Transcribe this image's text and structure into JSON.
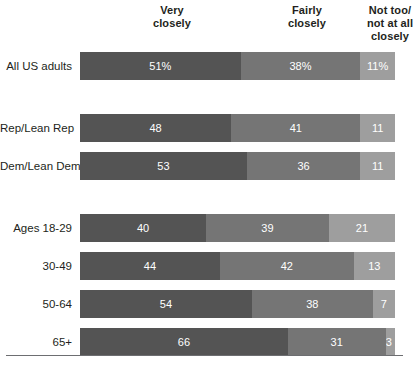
{
  "chart_data": {
    "type": "bar",
    "subtype": "stacked-horizontal-100pct",
    "title": "",
    "xlabel": "",
    "ylabel": "",
    "xlim": [
      0,
      100
    ],
    "grid": false,
    "legend_position": "top-as-column-headers",
    "categories": [
      "All US adults",
      "Rep/Lean Rep",
      "Dem/Lean Dem",
      "Ages 18-29",
      "30-49",
      "50-64",
      "65+"
    ],
    "series": [
      {
        "name": "Very closely",
        "color": "#545454",
        "values": [
          51,
          48,
          53,
          40,
          44,
          54,
          66
        ]
      },
      {
        "name": "Fairly closely",
        "color": "#757575",
        "values": [
          38,
          41,
          36,
          39,
          42,
          38,
          31
        ]
      },
      {
        "name": "Not too/not at all closely",
        "color": "#9e9e9e",
        "values": [
          11,
          11,
          11,
          21,
          13,
          7,
          3
        ]
      }
    ]
  },
  "headers": [
    {
      "name": "very-closely",
      "line1": "Very",
      "line2": "closely"
    },
    {
      "name": "fairly-closely",
      "line1": "Fairly",
      "line2": "closely"
    },
    {
      "name": "not-too-not-at-all",
      "line1": "Not too/",
      "line2": "not at all",
      "line3": "closely"
    }
  ],
  "rows": [
    {
      "label": "All US adults",
      "top": 52,
      "segments": [
        {
          "value": 51,
          "text": "51%",
          "style": "s0"
        },
        {
          "value": 38,
          "text": "38%",
          "style": "s1"
        },
        {
          "value": 11,
          "text": "11%",
          "style": "s2"
        }
      ]
    },
    {
      "label": "Rep/Lean Rep",
      "top": 114,
      "segments": [
        {
          "value": 48,
          "text": "48",
          "style": "s0"
        },
        {
          "value": 41,
          "text": "41",
          "style": "s1"
        },
        {
          "value": 11,
          "text": "11",
          "style": "s2"
        }
      ]
    },
    {
      "label": "Dem/Lean Dem",
      "top": 152,
      "segments": [
        {
          "value": 53,
          "text": "53",
          "style": "s0"
        },
        {
          "value": 36,
          "text": "36",
          "style": "s1"
        },
        {
          "value": 11,
          "text": "11",
          "style": "s2"
        }
      ]
    },
    {
      "label": "Ages 18-29",
      "top": 214,
      "segments": [
        {
          "value": 40,
          "text": "40",
          "style": "s0"
        },
        {
          "value": 39,
          "text": "39",
          "style": "s1"
        },
        {
          "value": 21,
          "text": "21",
          "style": "s2"
        }
      ]
    },
    {
      "label": "30-49",
      "top": 252,
      "segments": [
        {
          "value": 44,
          "text": "44",
          "style": "s0"
        },
        {
          "value": 42,
          "text": "42",
          "style": "s1"
        },
        {
          "value": 13,
          "text": "13",
          "style": "s2"
        }
      ]
    },
    {
      "label": "50-64",
      "top": 290,
      "segments": [
        {
          "value": 54,
          "text": "54",
          "style": "s0"
        },
        {
          "value": 38,
          "text": "38",
          "style": "s1"
        },
        {
          "value": 7,
          "text": "7",
          "style": "s2"
        }
      ]
    },
    {
      "label": "65+",
      "top": 328,
      "segments": [
        {
          "value": 66,
          "text": "66",
          "style": "s0"
        },
        {
          "value": 31,
          "text": "31",
          "style": "s1"
        },
        {
          "value": 3,
          "text": "3",
          "style": "s2"
        }
      ]
    }
  ],
  "colors": {
    "very_closely": "#545454",
    "fairly_closely": "#757575",
    "not_too": "#9e9e9e",
    "rule": "#6d6e71",
    "text": "#231f20",
    "value_text": "#ffffff"
  }
}
